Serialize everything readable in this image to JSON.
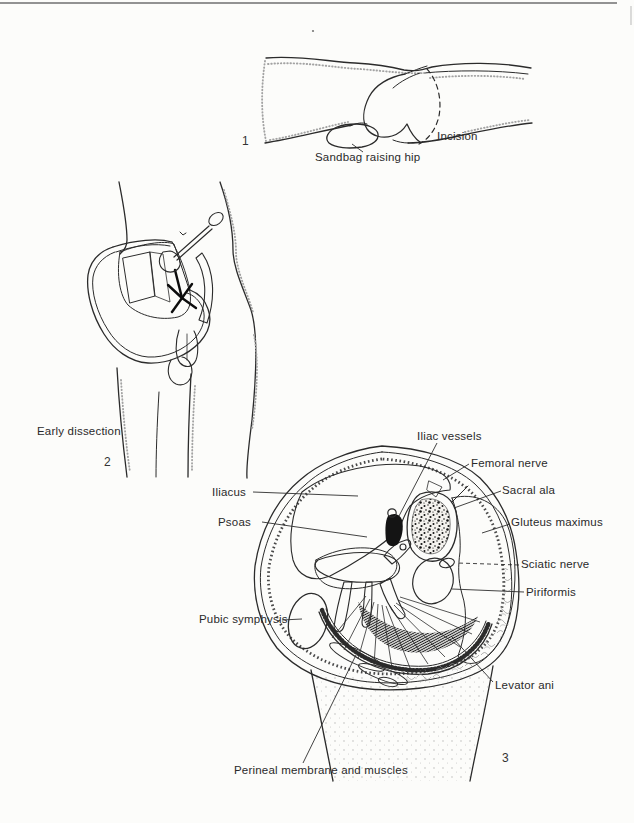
{
  "page": {
    "colors": {
      "background": "#fcfcfa",
      "ink": "#2b2b2b"
    }
  },
  "figure1": {
    "number": "1",
    "labels": {
      "incision": "Incision",
      "sandbag": "Sandbag raising hip"
    }
  },
  "figure2": {
    "number": "2",
    "caption": "Early dissection"
  },
  "figure3": {
    "number": "3",
    "labels": {
      "iliac_vessels": "Iliac vessels",
      "femoral_nerve": "Femoral nerve",
      "sacral_ala": "Sacral ala",
      "gluteus_maximus": "Gluteus maximus",
      "sciatic_nerve": "Sciatic nerve",
      "piriformis": "Piriformis",
      "iliacus": "Iliacus",
      "psoas": "Psoas",
      "pubic_symphysis": "Pubic symphysis",
      "levator_ani": "Levator ani",
      "perineal_membrane": "Perineal membrane and muscles"
    }
  }
}
